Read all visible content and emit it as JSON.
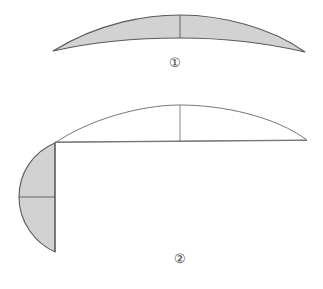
{
  "page": {
    "background_color": "#ffffff",
    "width": 323,
    "height": 289
  },
  "style": {
    "fill_gray": "#d2d2d2",
    "stroke_dark": "#5a5a5a",
    "stroke_light": "#767676",
    "stroke_width_outer": 1.1,
    "stroke_width_inner": 0.9,
    "label_color": "#404040"
  },
  "figures": [
    {
      "id": "figure-1",
      "label": "①",
      "label_text": "1",
      "label_style": "circled-number",
      "description": "Shaded horizontal lune (crescent) with a vertical chord divider at its midpoint.",
      "shaded": true,
      "geometry": {
        "left_tip": [
          53,
          51
        ],
        "right_tip": [
          305,
          52
        ],
        "upper_arc_apex": [
          180,
          15
        ],
        "lower_arc_apex": [
          180,
          47
        ],
        "divider_line": {
          "x": 180,
          "y_top": 15,
          "y_bottom": 47
        }
      }
    },
    {
      "id": "figure-2",
      "label": "②",
      "label_text": "2",
      "label_style": "circled-number",
      "description": "Unshaded upper lune on a horizontal baseline with a vertical chord divider, plus a shaded half-lune below left with a horizontal chord divider.",
      "shaded": false,
      "geometry": {
        "corner_point": [
          55,
          143
        ],
        "right_tip": [
          307,
          140
        ],
        "upper_arc_apex": [
          180,
          105
        ],
        "baseline": {
          "y": 142,
          "x_start": 55,
          "x_end": 307
        },
        "divider_line": {
          "x": 180,
          "y_top": 105,
          "y_bottom": 142
        }
      },
      "sub_shape": {
        "id": "figure-2-lune",
        "description": "Shaded vertical half-lune, leftward bulge, split by a horizontal chord.",
        "shaded": true,
        "geometry": {
          "top_point": [
            55,
            143
          ],
          "bottom_point": [
            55,
            252
          ],
          "left_apex": [
            19,
            197
          ],
          "chord_line": {
            "y": 197,
            "x_start": 19,
            "x_end": 55
          }
        }
      }
    }
  ]
}
